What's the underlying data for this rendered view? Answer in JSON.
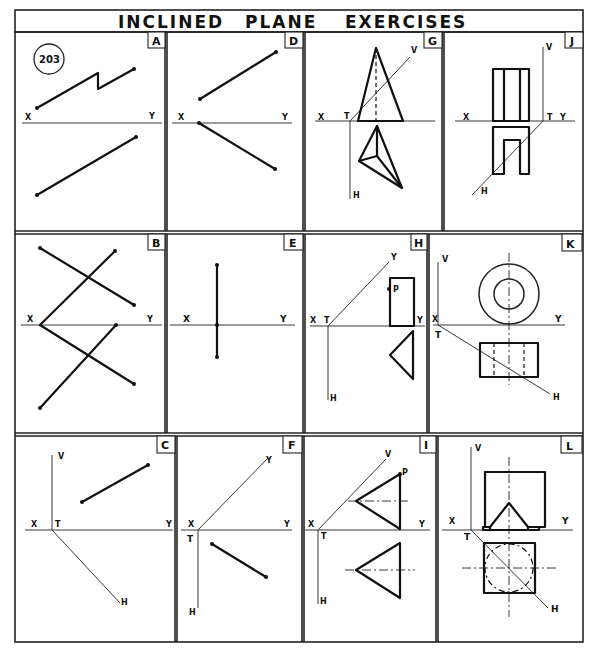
{
  "title": {
    "word1": "INCLINED",
    "word2": "PLANE",
    "word3": "EXERCISES"
  },
  "exercise_number": "203",
  "panels": [
    {
      "id": "A",
      "label": "A"
    },
    {
      "id": "B",
      "label": "B"
    },
    {
      "id": "C",
      "label": "C"
    },
    {
      "id": "D",
      "label": "D"
    },
    {
      "id": "E",
      "label": "E"
    },
    {
      "id": "F",
      "label": "F"
    },
    {
      "id": "G",
      "label": "G"
    },
    {
      "id": "H",
      "label": "H"
    },
    {
      "id": "I",
      "label": "I"
    },
    {
      "id": "J",
      "label": "J"
    },
    {
      "id": "K",
      "label": "K"
    },
    {
      "id": "L",
      "label": "L"
    }
  ],
  "axis_labels": {
    "x": "X",
    "y": "Y",
    "v": "V",
    "h": "H",
    "t": "T",
    "p": "P"
  }
}
